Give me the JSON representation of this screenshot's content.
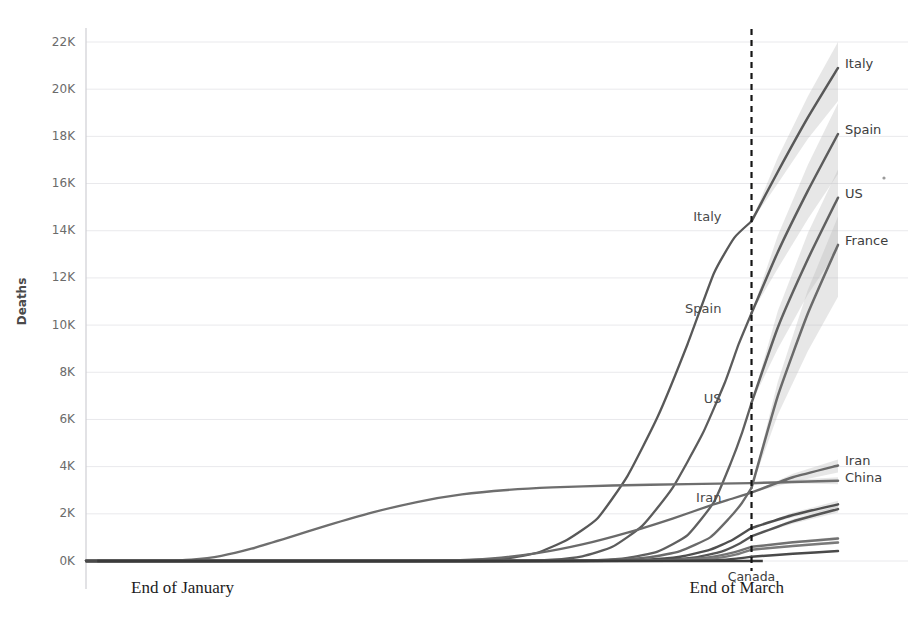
{
  "chart_data": {
    "type": "line",
    "title": "",
    "subtitle": "",
    "xlabel": "",
    "ylabel": "Deaths",
    "grid": true,
    "legend_position": "inline-right-labels",
    "ylim": [
      0,
      22000
    ],
    "ytick_labels": [
      "0K",
      "2K",
      "4K",
      "6K",
      "8K",
      "10K",
      "12K",
      "14K",
      "16K",
      "18K",
      "20K",
      "22K"
    ],
    "ytick_values": [
      0,
      2000,
      4000,
      6000,
      8000,
      10000,
      12000,
      14000,
      16000,
      18000,
      20000,
      22000
    ],
    "xtick_labels": [
      "End of January",
      "End of March"
    ],
    "xtick_positions": [
      0.06,
      0.885
    ],
    "annotations": [
      {
        "text": "Italy",
        "anchor": "end",
        "x": 0.845,
        "y": 14400
      },
      {
        "text": "Spain",
        "anchor": "end",
        "x": 0.845,
        "y": 10500
      },
      {
        "text": "US",
        "anchor": "end",
        "x": 0.845,
        "y": 6700
      },
      {
        "text": "Iran",
        "anchor": "end",
        "x": 0.845,
        "y": 2500
      },
      {
        "text": "Canada",
        "anchor": "middle",
        "x": 0.885,
        "y": -850
      }
    ],
    "forecast_divider": {
      "label": "End of March",
      "x": 0.885
    },
    "forecast_note": "dashed vertical line separates observed history (left) from projected values with shaded uncertainty bands (right)",
    "series": [
      {
        "name": "Italy",
        "color": "#585858",
        "end_label": "Italy",
        "observed_final": 14400,
        "projected_final": 20900,
        "projected_low": 19500,
        "projected_high": 22000,
        "history": [
          [
            0.0,
            0
          ],
          [
            0.3,
            0
          ],
          [
            0.42,
            5
          ],
          [
            0.5,
            25
          ],
          [
            0.56,
            120
          ],
          [
            0.6,
            350
          ],
          [
            0.64,
            900
          ],
          [
            0.68,
            1800
          ],
          [
            0.72,
            3600
          ],
          [
            0.76,
            6100
          ],
          [
            0.8,
            9200
          ],
          [
            0.835,
            12200
          ],
          [
            0.862,
            13700
          ],
          [
            0.885,
            14400
          ]
        ],
        "forecast": [
          [
            0.885,
            14400
          ],
          [
            0.92,
            16500
          ],
          [
            0.96,
            18800
          ],
          [
            1.0,
            20900
          ]
        ],
        "band_low": [
          [
            0.885,
            14400
          ],
          [
            0.92,
            16000
          ],
          [
            0.96,
            17900
          ],
          [
            1.0,
            19500
          ]
        ],
        "band_high": [
          [
            0.885,
            14400
          ],
          [
            0.92,
            17100
          ],
          [
            0.96,
            19700
          ],
          [
            1.0,
            22000
          ]
        ]
      },
      {
        "name": "Spain",
        "color": "#5c5c5c",
        "end_label": "Spain",
        "observed_final": 10500,
        "projected_final": 18100,
        "projected_low": 16400,
        "projected_high": 19400,
        "history": [
          [
            0.0,
            0
          ],
          [
            0.44,
            0
          ],
          [
            0.56,
            10
          ],
          [
            0.62,
            60
          ],
          [
            0.66,
            200
          ],
          [
            0.7,
            600
          ],
          [
            0.74,
            1500
          ],
          [
            0.78,
            3100
          ],
          [
            0.82,
            5400
          ],
          [
            0.85,
            7600
          ],
          [
            0.868,
            9200
          ],
          [
            0.885,
            10500
          ]
        ],
        "forecast": [
          [
            0.885,
            10500
          ],
          [
            0.92,
            13100
          ],
          [
            0.96,
            15700
          ],
          [
            1.0,
            18100
          ]
        ],
        "band_low": [
          [
            0.885,
            10500
          ],
          [
            0.92,
            12400
          ],
          [
            0.96,
            14500
          ],
          [
            1.0,
            16400
          ]
        ],
        "band_high": [
          [
            0.885,
            10500
          ],
          [
            0.92,
            13800
          ],
          [
            0.96,
            16800
          ],
          [
            1.0,
            19400
          ]
        ]
      },
      {
        "name": "US",
        "color": "#606060",
        "end_label": "US",
        "observed_final": 6700,
        "projected_final": 15400,
        "projected_low": 13200,
        "projected_high": 16600,
        "history": [
          [
            0.0,
            0
          ],
          [
            0.5,
            0
          ],
          [
            0.62,
            10
          ],
          [
            0.68,
            40
          ],
          [
            0.72,
            130
          ],
          [
            0.76,
            400
          ],
          [
            0.8,
            1100
          ],
          [
            0.835,
            2500
          ],
          [
            0.858,
            4200
          ],
          [
            0.872,
            5400
          ],
          [
            0.885,
            6700
          ]
        ],
        "forecast": [
          [
            0.885,
            6700
          ],
          [
            0.92,
            9900
          ],
          [
            0.96,
            12800
          ],
          [
            1.0,
            15400
          ]
        ],
        "band_low": [
          [
            0.885,
            6700
          ],
          [
            0.92,
            9000
          ],
          [
            0.96,
            11300
          ],
          [
            1.0,
            13200
          ]
        ],
        "band_high": [
          [
            0.885,
            6700
          ],
          [
            0.92,
            10600
          ],
          [
            0.96,
            13900
          ],
          [
            1.0,
            16600
          ]
        ]
      },
      {
        "name": "France",
        "color": "#6a6a6a",
        "end_label": "France",
        "observed_final": 3100,
        "projected_final": 13400,
        "projected_low": 11200,
        "projected_high": 14600,
        "history": [
          [
            0.0,
            0
          ],
          [
            0.52,
            0
          ],
          [
            0.64,
            8
          ],
          [
            0.7,
            45
          ],
          [
            0.75,
            160
          ],
          [
            0.79,
            420
          ],
          [
            0.83,
            1000
          ],
          [
            0.855,
            1800
          ],
          [
            0.872,
            2450
          ],
          [
            0.885,
            3100
          ]
        ],
        "forecast": [
          [
            0.885,
            3100
          ],
          [
            0.92,
            7000
          ],
          [
            0.96,
            10500
          ],
          [
            1.0,
            13400
          ]
        ],
        "band_low": [
          [
            0.885,
            3100
          ],
          [
            0.92,
            6200
          ],
          [
            0.96,
            8900
          ],
          [
            1.0,
            11200
          ]
        ],
        "band_high": [
          [
            0.885,
            3100
          ],
          [
            0.92,
            7600
          ],
          [
            0.96,
            11500
          ],
          [
            1.0,
            14600
          ]
        ]
      },
      {
        "name": "China",
        "color": "#6e6e6e",
        "end_label": "China",
        "observed_final": 3300,
        "projected_final": 3400,
        "projected_low": 3250,
        "projected_high": 3550,
        "history": [
          [
            0.0,
            0
          ],
          [
            0.05,
            0
          ],
          [
            0.1,
            10
          ],
          [
            0.14,
            60
          ],
          [
            0.18,
            220
          ],
          [
            0.22,
            520
          ],
          [
            0.27,
            1000
          ],
          [
            0.32,
            1500
          ],
          [
            0.38,
            2050
          ],
          [
            0.44,
            2500
          ],
          [
            0.5,
            2820
          ],
          [
            0.56,
            3010
          ],
          [
            0.62,
            3120
          ],
          [
            0.7,
            3200
          ],
          [
            0.8,
            3260
          ],
          [
            0.885,
            3300
          ]
        ],
        "forecast": [
          [
            0.885,
            3300
          ],
          [
            0.95,
            3360
          ],
          [
            1.0,
            3400
          ]
        ],
        "band_low": [
          [
            0.885,
            3300
          ],
          [
            0.95,
            3280
          ],
          [
            1.0,
            3250
          ]
        ],
        "band_high": [
          [
            0.885,
            3300
          ],
          [
            0.95,
            3450
          ],
          [
            1.0,
            3550
          ]
        ]
      },
      {
        "name": "Iran",
        "color": "#6a6a6a",
        "end_label": "Iran",
        "observed_final": 2900,
        "projected_final": 4050,
        "projected_low": 3750,
        "projected_high": 4300,
        "history": [
          [
            0.0,
            0
          ],
          [
            0.4,
            0
          ],
          [
            0.48,
            20
          ],
          [
            0.54,
            110
          ],
          [
            0.6,
            330
          ],
          [
            0.66,
            700
          ],
          [
            0.72,
            1200
          ],
          [
            0.78,
            1800
          ],
          [
            0.83,
            2350
          ],
          [
            0.86,
            2650
          ],
          [
            0.885,
            2900
          ]
        ],
        "forecast": [
          [
            0.885,
            2900
          ],
          [
            0.94,
            3550
          ],
          [
            1.0,
            4050
          ]
        ],
        "band_low": [
          [
            0.885,
            2900
          ],
          [
            0.94,
            3350
          ],
          [
            1.0,
            3750
          ]
        ],
        "band_high": [
          [
            0.885,
            2900
          ],
          [
            0.94,
            3700
          ],
          [
            1.0,
            4300
          ]
        ]
      },
      {
        "name": "UK",
        "color": "#4f4f4f",
        "end_label": "",
        "observed_final": 1400,
        "projected_final": 2400,
        "projected_low": 2250,
        "projected_high": 2550,
        "history": [
          [
            0.0,
            0
          ],
          [
            0.56,
            0
          ],
          [
            0.68,
            10
          ],
          [
            0.74,
            50
          ],
          [
            0.79,
            180
          ],
          [
            0.83,
            480
          ],
          [
            0.86,
            900
          ],
          [
            0.885,
            1400
          ]
        ],
        "forecast": [
          [
            0.885,
            1400
          ],
          [
            0.94,
            1950
          ],
          [
            1.0,
            2400
          ]
        ],
        "band_low": [
          [
            0.885,
            1400
          ],
          [
            0.94,
            1850
          ],
          [
            1.0,
            2250
          ]
        ],
        "band_high": [
          [
            0.885,
            1400
          ],
          [
            0.94,
            2050
          ],
          [
            1.0,
            2550
          ]
        ]
      },
      {
        "name": "Netherlands",
        "color": "#555555",
        "end_label": "",
        "observed_final": 1050,
        "projected_final": 2200,
        "projected_low": 2050,
        "projected_high": 2350,
        "history": [
          [
            0.0,
            0
          ],
          [
            0.58,
            0
          ],
          [
            0.7,
            8
          ],
          [
            0.76,
            40
          ],
          [
            0.81,
            150
          ],
          [
            0.845,
            400
          ],
          [
            0.868,
            720
          ],
          [
            0.885,
            1050
          ]
        ],
        "forecast": [
          [
            0.885,
            1050
          ],
          [
            0.94,
            1680
          ],
          [
            1.0,
            2200
          ]
        ],
        "band_low": [
          [
            0.885,
            1050
          ],
          [
            0.94,
            1580
          ],
          [
            1.0,
            2050
          ]
        ],
        "band_high": [
          [
            0.885,
            1050
          ],
          [
            0.94,
            1780
          ],
          [
            1.0,
            2350
          ]
        ]
      },
      {
        "name": "Germany",
        "color": "#727272",
        "end_label": "",
        "observed_final": 600,
        "projected_final": 950,
        "projected_low": 880,
        "projected_high": 1030,
        "history": [
          [
            0.0,
            0
          ],
          [
            0.55,
            0
          ],
          [
            0.7,
            5
          ],
          [
            0.78,
            40
          ],
          [
            0.83,
            160
          ],
          [
            0.86,
            350
          ],
          [
            0.885,
            600
          ]
        ],
        "forecast": [
          [
            0.885,
            600
          ],
          [
            0.94,
            790
          ],
          [
            1.0,
            950
          ]
        ],
        "band_low": [
          [
            0.885,
            600
          ],
          [
            0.94,
            740
          ],
          [
            1.0,
            880
          ]
        ],
        "band_high": [
          [
            0.885,
            600
          ],
          [
            0.94,
            840
          ],
          [
            1.0,
            1030
          ]
        ]
      },
      {
        "name": "Belgium",
        "color": "#7a7a7a",
        "end_label": "",
        "observed_final": 480,
        "projected_final": 780,
        "projected_low": 720,
        "projected_high": 850,
        "history": [
          [
            0.0,
            0
          ],
          [
            0.6,
            0
          ],
          [
            0.72,
            5
          ],
          [
            0.79,
            30
          ],
          [
            0.84,
            130
          ],
          [
            0.865,
            280
          ],
          [
            0.885,
            480
          ]
        ],
        "forecast": [
          [
            0.885,
            480
          ],
          [
            0.94,
            640
          ],
          [
            1.0,
            780
          ]
        ],
        "band_low": [
          [
            0.885,
            480
          ],
          [
            0.94,
            600
          ],
          [
            1.0,
            720
          ]
        ],
        "band_high": [
          [
            0.885,
            480
          ],
          [
            0.94,
            690
          ],
          [
            1.0,
            850
          ]
        ]
      },
      {
        "name": "Canada",
        "color": "#4a4a4a",
        "end_label": "",
        "observed_final": 180,
        "projected_final": 420,
        "projected_low": 380,
        "projected_high": 470,
        "history": [
          [
            0.0,
            0
          ],
          [
            0.66,
            0
          ],
          [
            0.78,
            5
          ],
          [
            0.84,
            40
          ],
          [
            0.865,
            100
          ],
          [
            0.885,
            180
          ]
        ],
        "forecast": [
          [
            0.885,
            180
          ],
          [
            0.94,
            310
          ],
          [
            1.0,
            420
          ]
        ],
        "band_low": [
          [
            0.885,
            180
          ],
          [
            0.94,
            285
          ],
          [
            1.0,
            380
          ]
        ],
        "band_high": [
          [
            0.885,
            180
          ],
          [
            0.94,
            340
          ],
          [
            1.0,
            470
          ]
        ]
      }
    ],
    "right_labels": [
      {
        "text": "Italy",
        "y": 20900
      },
      {
        "text": "Spain",
        "y": 18100
      },
      {
        "text": "US",
        "y": 15400
      },
      {
        "text": "France",
        "y": 13400
      },
      {
        "text": "Iran",
        "y": 4050
      },
      {
        "text": "China",
        "y": 3350
      }
    ]
  }
}
